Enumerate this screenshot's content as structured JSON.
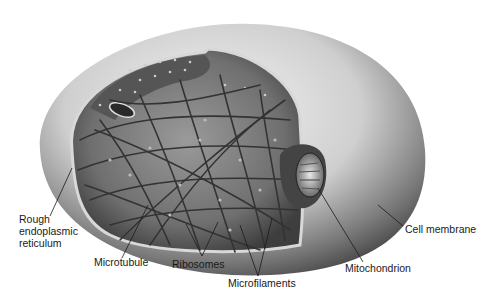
{
  "diagram": {
    "labels": {
      "rough_er": [
        "Rough",
        "endoplasmic",
        "reticulum"
      ],
      "microtubule": "Microtubule",
      "ribosomes": "Ribosomes",
      "microfilaments": "Microfilaments",
      "mitochondrion": "Mitochondrion",
      "cell_membrane": "Cell membrane"
    },
    "colors": {
      "outer_light": "#f2f2f2",
      "outer_dark": "#5a5a5a",
      "interior": "#8a8a8a",
      "fiber": "#3a3a3a",
      "label_text": "#1a1a1a"
    }
  }
}
